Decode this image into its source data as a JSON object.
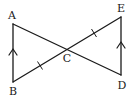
{
  "diagram": {
    "points": {
      "A": {
        "label": "A",
        "x": 13,
        "y": 24,
        "lx": 12,
        "ly": 19
      },
      "B": {
        "label": "B",
        "x": 13,
        "y": 82,
        "lx": 13,
        "ly": 95
      },
      "C": {
        "label": "C",
        "x": 67,
        "y": 49,
        "lx": 67,
        "ly": 62
      },
      "D": {
        "label": "D",
        "x": 121,
        "y": 75,
        "lx": 122,
        "ly": 89
      },
      "E": {
        "label": "E",
        "x": 121,
        "y": 17,
        "lx": 121,
        "ly": 12
      }
    },
    "segments": [
      {
        "id": "AB",
        "from": "A",
        "to": "B"
      },
      {
        "id": "AD",
        "from": "A",
        "to": "D"
      },
      {
        "id": "BE",
        "from": "B",
        "to": "E"
      },
      {
        "id": "ED",
        "from": "E",
        "to": "D"
      }
    ],
    "parallel_marks": [
      {
        "segment": "AB",
        "direction": "up",
        "tip_y": 50
      },
      {
        "segment": "ED",
        "direction": "up",
        "tip_y": 43
      }
    ],
    "equal_length_ticks": [
      {
        "segment": "BC",
        "count": 1
      },
      {
        "segment": "CE",
        "count": 1
      }
    ],
    "stroke_color": "#1a1a1a",
    "background_color": "#ffffff"
  }
}
